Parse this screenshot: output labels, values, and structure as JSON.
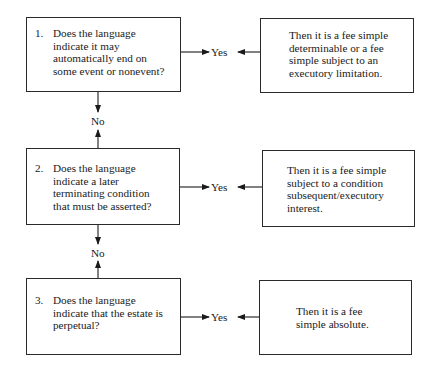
{
  "questions": [
    {
      "number": "1.",
      "text": "Does the language indicate it may automatically end on some event or nonevent?",
      "lines": [
        "Does the language",
        "indicate it may",
        "automatically end on",
        "some event or nonevent?"
      ]
    },
    {
      "number": "2.",
      "text": "Does the language indicate a later terminating condition that must be asserted?",
      "lines": [
        "Does the language",
        "indicate a later",
        "terminating condition",
        "that must be asserted?"
      ]
    },
    {
      "number": "3.",
      "text": "Does the language indicate that the estate is perpetual?",
      "lines": [
        "Does the language",
        "indicate that the estate is",
        "perpetual?"
      ]
    }
  ],
  "results": [
    {
      "text": "Then it is a fee simple determinable or a fee simple subject to an executory limitation.",
      "lines": [
        "Then it is a fee simple",
        "determinable or a fee",
        "simple subject to an",
        "executory limitation."
      ]
    },
    {
      "text": "Then it is a fee simple subject to a condition subsequent/executory interest.",
      "lines": [
        "Then it is a fee simple",
        "subject to a condition",
        "subsequent/executory",
        "interest."
      ]
    },
    {
      "text": "Then it is a fee simple absolute.",
      "lines": [
        "Then it is a fee",
        "simple absolute."
      ]
    }
  ],
  "labels": {
    "yes": "Yes",
    "no": "No"
  }
}
